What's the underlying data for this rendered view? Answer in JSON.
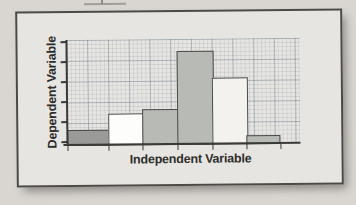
{
  "page": {
    "artifact_note": "partial printed mark cropped at top edge of scan"
  },
  "card": {
    "background": "#e7e5e1",
    "border_color": "#4c4a47"
  },
  "chart_data": {
    "type": "bar",
    "subtype": "histogram-style adjacent bars on fine graph-paper grid",
    "title": "",
    "xlabel": "Independent Variable",
    "ylabel": "Dependent Variable",
    "categories": [
      "bar-1",
      "bar-2",
      "bar-3",
      "bar-4",
      "bar-5",
      "bar-6"
    ],
    "values": [
      0.8,
      1.6,
      1.8,
      4.7,
      3.35,
      0.45
    ],
    "value_units": "y-axis tick divisions (axes carry no numeric labels)",
    "ylim": [
      0,
      5.2
    ],
    "y_tick_count": 6,
    "y_tick_labels": [],
    "x_tick_count": 7,
    "x_tick_labels": [],
    "grid": "on (fine graph paper, stronger line every 5 cells)",
    "legend": "none",
    "bar_fills": [
      "#9a9a98",
      "#fdfdfb",
      "#b8bab6",
      "#b8bab6",
      "#f3f2ee",
      "#b8bab6"
    ],
    "bar_border_color": "#4a4c49",
    "axis_color": "#3a3a38"
  }
}
